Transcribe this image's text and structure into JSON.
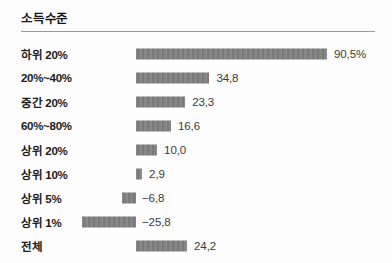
{
  "chart": {
    "title": "소득수준",
    "value_suffix_first": "%",
    "bar_color": "#7e7e7e",
    "rule_color": "#9a9a9a"
  },
  "chart_data": {
    "type": "bar",
    "orientation": "horizontal",
    "title": "소득수준",
    "xlabel": "",
    "ylabel": "",
    "grid": false,
    "legend": null,
    "baseline": 0,
    "categories": [
      "하위 20%",
      "20%~40%",
      "중간 20%",
      "60%~80%",
      "상위 20%",
      "상위 10%",
      "상위 5%",
      "상위 1%",
      "전체"
    ],
    "values": [
      90.5,
      34.8,
      23.3,
      16.6,
      10.0,
      2.9,
      -6.8,
      -25.8,
      24.2
    ],
    "data_labels": [
      "90,5%",
      "34,8",
      "23,3",
      "16,6",
      "10,0",
      "2,9",
      "−6,8",
      "−25,8",
      "24,2"
    ]
  },
  "rows": [
    {
      "label": "하위 20%",
      "value": 90.5,
      "display": "90,5%"
    },
    {
      "label": "20%~40%",
      "value": 34.8,
      "display": "34,8"
    },
    {
      "label": "중간 20%",
      "value": 23.3,
      "display": "23,3"
    },
    {
      "label": "60%~80%",
      "value": 16.6,
      "display": "16,6"
    },
    {
      "label": "상위 20%",
      "value": 10.0,
      "display": "10,0"
    },
    {
      "label": "상위 10%",
      "value": 2.9,
      "display": "2,9"
    },
    {
      "label": "상위 5%",
      "value": -6.8,
      "display": "−6,8"
    },
    {
      "label": "상위 1%",
      "value": -25.8,
      "display": "−25,8"
    },
    {
      "label": "전체",
      "value": 24.2,
      "display": "24,2"
    }
  ]
}
